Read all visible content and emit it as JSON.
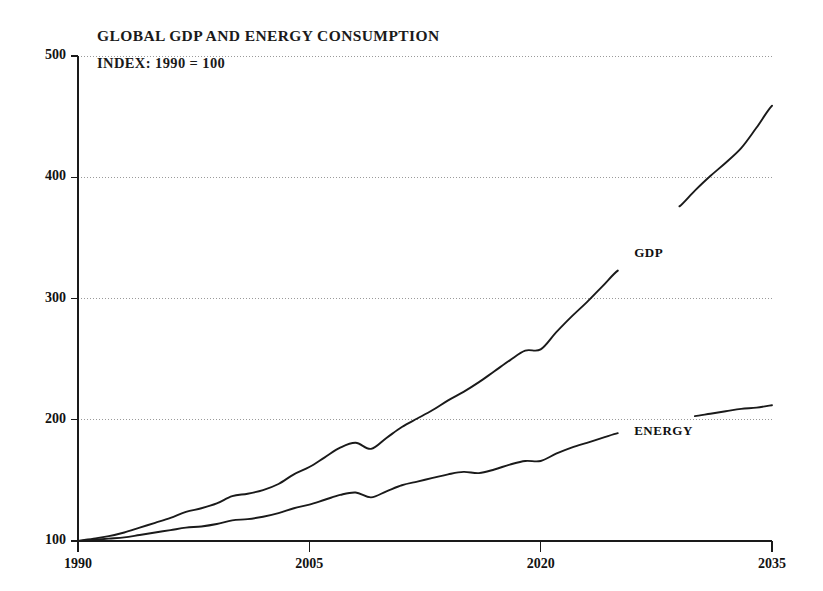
{
  "chart_data": {
    "type": "line",
    "title": "GLOBAL GDP AND ENERGY CONSUMPTION",
    "subtitle": "INDEX:  1990 = 100",
    "xlabel": "",
    "ylabel": "",
    "xlim": [
      1990,
      2035
    ],
    "ylim": [
      100,
      500
    ],
    "xticks": [
      "1990",
      "2005",
      "2020",
      "2035"
    ],
    "xtick_values": [
      1990,
      2005,
      2020,
      2035
    ],
    "yticks": [
      "100",
      "200",
      "300",
      "400",
      "500"
    ],
    "ytick_values": [
      100,
      200,
      300,
      400,
      500
    ],
    "grid": "horizontal-dotted",
    "legend": "inline-labels",
    "x": [
      1990,
      1991,
      1992,
      1993,
      1994,
      1995,
      1996,
      1997,
      1998,
      1999,
      2000,
      2001,
      2002,
      2003,
      2004,
      2005,
      2006,
      2007,
      2008,
      2009,
      2010,
      2011,
      2012,
      2013,
      2014,
      2015,
      2016,
      2017,
      2018,
      2019,
      2020,
      2021,
      2022,
      2023,
      2024,
      2025,
      2026,
      2027,
      2028,
      2029,
      2030,
      2031,
      2032,
      2033,
      2034,
      2035
    ],
    "series": [
      {
        "name": "GDP",
        "label": "GDP",
        "color": "#1a1a1a",
        "label_x": 2026,
        "label_y": 337,
        "values": [
          100,
          102,
          104,
          107,
          111,
          115,
          119,
          124,
          127,
          131,
          137,
          139,
          142,
          147,
          155,
          161,
          169,
          177,
          181,
          176,
          185,
          194,
          201,
          208,
          216,
          223,
          231,
          240,
          249,
          257,
          258,
          272,
          285,
          297,
          310,
          323,
          337,
          350,
          363,
          376,
          389,
          401,
          412,
          424,
          441,
          459
        ]
      },
      {
        "name": "ENERGY",
        "label": "ENERGY",
        "color": "#1a1a1a",
        "label_x": 2026,
        "label_y": 190,
        "values": [
          100,
          101,
          102,
          103,
          105,
          107,
          109,
          111,
          112,
          114,
          117,
          118,
          120,
          123,
          127,
          130,
          134,
          138,
          140,
          136,
          141,
          146,
          149,
          152,
          155,
          157,
          156,
          159,
          163,
          166,
          166,
          172,
          177,
          181,
          185,
          189,
          192,
          195,
          198,
          201,
          203,
          205,
          207,
          209,
          210,
          212
        ]
      }
    ]
  },
  "axes": {
    "frame_color": "#1a1a1a",
    "grid_color": "#9a9a9a"
  }
}
